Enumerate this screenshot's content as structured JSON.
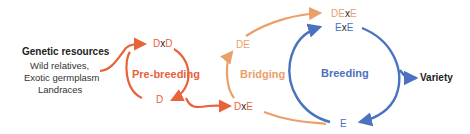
{
  "colors": {
    "prebreeding": "#e8623a",
    "bridging": "#e9a06a",
    "breeding": "#4a72c0",
    "text": "#222222"
  },
  "genetic_resources": {
    "title": "Genetic resources",
    "items": [
      "Wild relatives,",
      "Exotic germplasm",
      "Landraces"
    ]
  },
  "phases": {
    "prebreeding": "Pre-breeding",
    "bridging": "Bridging",
    "breeding": "Breeding"
  },
  "nodes": {
    "dxd": {
      "left": "D",
      "x": "x",
      "right": "D"
    },
    "d": "D",
    "dxe": {
      "left": "D",
      "x": "x",
      "right": "E"
    },
    "de": "DE",
    "dexe": {
      "left": "DE",
      "x": "x",
      "right": "E"
    },
    "exe": {
      "left": "E",
      "x": "x",
      "right": "E"
    },
    "e": "E"
  },
  "output": "Variety"
}
